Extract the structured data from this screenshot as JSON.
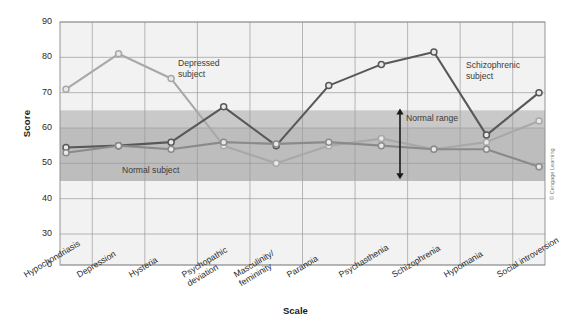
{
  "chart_data": {
    "type": "line",
    "title": "",
    "xlabel": "Scale",
    "ylabel": "Score",
    "ylim": [
      0,
      90
    ],
    "yticks": [
      90,
      80,
      70,
      60,
      50,
      40,
      30,
      0
    ],
    "axis_broken_below": 30,
    "grid": true,
    "legend_position": "inline-annotations",
    "categories": [
      "Hypochondriasis",
      "Depression",
      "Hysteria",
      "Psychopathic deviation",
      "Masculinity/ femininity",
      "Paranoia",
      "Psychasthenia",
      "Schizophrenia",
      "Hypomania",
      "Social introversion"
    ],
    "category_lines": [
      [
        "Hypochondriasis"
      ],
      [
        "Depression"
      ],
      [
        "Hysteria"
      ],
      [
        "Psychopathic",
        "deviation"
      ],
      [
        "Masculinity/",
        "femininity"
      ],
      [
        "Paranoia"
      ],
      [
        "Psychasthenia"
      ],
      [
        "Schizophrenia"
      ],
      [
        "Hypomania"
      ],
      [
        "Social introversion"
      ]
    ],
    "series": [
      {
        "name": "Depressed subject",
        "color": "#a8a8a8",
        "values": [
          71,
          81,
          74,
          55,
          50,
          55,
          57,
          54,
          56,
          62
        ]
      },
      {
        "name": "Schizophrenic subject",
        "color": "#585858",
        "values": [
          54.5,
          55,
          56,
          66,
          55,
          72,
          78,
          81.5,
          58,
          70
        ]
      },
      {
        "name": "Normal subject",
        "color": "#8a8a8a",
        "values": [
          53,
          55,
          54,
          56,
          55.5,
          56,
          55,
          54,
          54,
          49
        ]
      }
    ],
    "bands": [
      {
        "label": "Normal range",
        "from": 45,
        "to": 65,
        "color": "#c9c9c9",
        "inner_from": 45,
        "inner_to": 60,
        "inner_color": "#bdbdbd"
      }
    ],
    "annotations": [
      {
        "name": "depressed-subject-label",
        "text_lines": [
          "Depressed",
          "subject"
        ],
        "x": 178,
        "y": 58
      },
      {
        "name": "schizophrenic-subject-label",
        "text_lines": [
          "Schizophrenic",
          "subject"
        ],
        "x": 466,
        "y": 60
      },
      {
        "name": "normal-subject-label",
        "text_lines": [
          "Normal subject"
        ],
        "x": 122,
        "y": 165
      },
      {
        "name": "normal-range-label",
        "text_lines": [
          "Normal range"
        ],
        "x": 406,
        "y": 113
      }
    ],
    "credit": "© Cengage Learning"
  }
}
